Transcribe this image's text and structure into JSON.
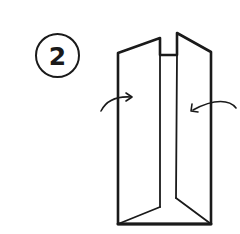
{
  "step": {
    "number": "2"
  },
  "illustration": {
    "subject": "folded-paper-standing-upright",
    "stroke_color": "#1a1a1a",
    "background_color": "#ffffff",
    "arrows": [
      {
        "name": "left-fold-arrow",
        "direction": "right"
      },
      {
        "name": "right-fold-arrow",
        "direction": "left"
      }
    ]
  }
}
